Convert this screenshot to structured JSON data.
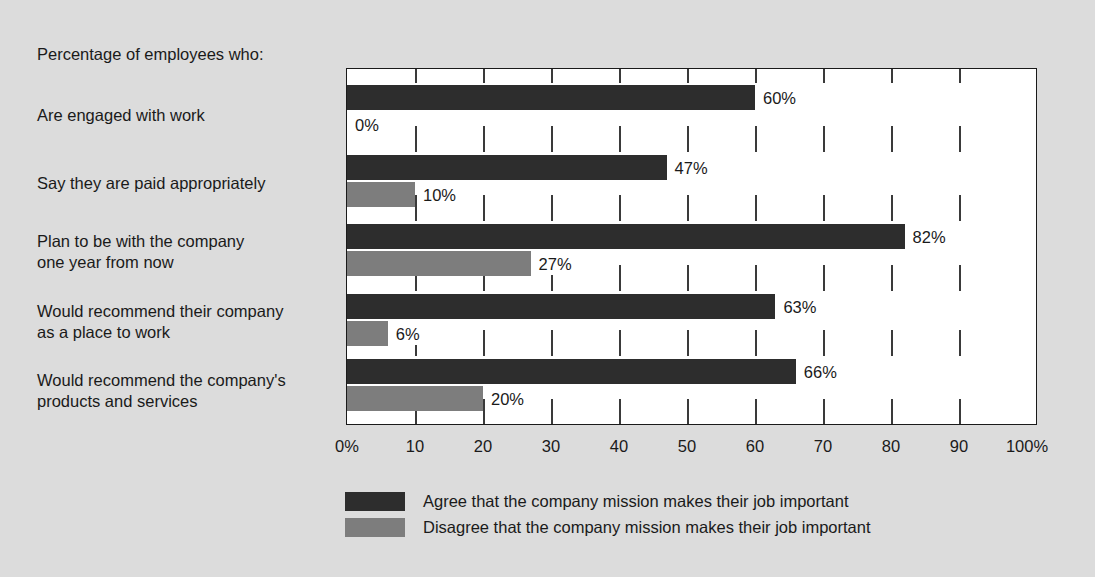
{
  "caption": "Percentage of employees who:",
  "chart_data": {
    "type": "bar",
    "orientation": "horizontal",
    "title": "Percentage of employees who:",
    "xlabel": "",
    "ylabel": "",
    "xlim": [
      0,
      100
    ],
    "grid": false,
    "legend_position": "bottom",
    "categories": [
      "Are engaged with work",
      "Say they are paid appropriately",
      "Plan to be with the company one year from now",
      "Would recommend their company as a place to work",
      "Would recommend the company's products and services"
    ],
    "series": [
      {
        "name": "Agree that the company mission makes their job important",
        "color": "#2d2d2d",
        "values": [
          60,
          47,
          82,
          63,
          66
        ],
        "labels": [
          "60%",
          "47%",
          "82%",
          "63%",
          "66%"
        ]
      },
      {
        "name": "Disagree that the company mission makes their job important",
        "color": "#7d7d7d",
        "values": [
          0,
          10,
          27,
          6,
          20
        ],
        "labels": [
          "0%",
          "10%",
          "27%",
          "6%",
          "20%"
        ]
      }
    ],
    "xticks": [
      0,
      10,
      20,
      30,
      40,
      50,
      60,
      70,
      80,
      90,
      100
    ],
    "xtick_labels": [
      "0%",
      "10",
      "20",
      "30",
      "40",
      "50",
      "60",
      "70",
      "80",
      "90",
      "100%"
    ]
  },
  "category_lines": [
    [
      "Are engaged with work"
    ],
    [
      "Say they are paid appropriately"
    ],
    [
      "Plan to be with the company",
      "one year from now"
    ],
    [
      "Would recommend their company",
      "as a place to work"
    ],
    [
      "Would recommend the company's",
      "products and services"
    ]
  ],
  "legend": {
    "items": [
      {
        "label": "Agree that the company mission makes their job important",
        "color": "#2d2d2d",
        "key": "agree"
      },
      {
        "label": "Disagree that the company mission makes their job important",
        "color": "#7d7d7d",
        "key": "disagree"
      }
    ]
  },
  "colors": {
    "background": "#dcdcdc",
    "plot_background": "#ffffff",
    "axis": "#1a1a1a",
    "agree": "#2d2d2d",
    "disagree": "#7d7d7d",
    "text": "#1a1a1a"
  }
}
